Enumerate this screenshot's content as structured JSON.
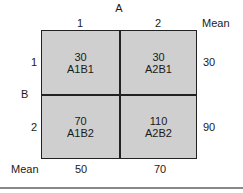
{
  "factor_a": {
    "label": "A",
    "levels": [
      "1",
      "2"
    ],
    "mean_label": "Mean"
  },
  "factor_b": {
    "label": "B",
    "levels": [
      "1",
      "2"
    ],
    "mean_label": "Mean"
  },
  "cells": [
    {
      "value": "30",
      "name": "A1B1"
    },
    {
      "value": "30",
      "name": "A2B1"
    },
    {
      "value": "70",
      "name": "A1B2"
    },
    {
      "value": "110",
      "name": "A2B2"
    }
  ],
  "row_means": [
    "30",
    "90"
  ],
  "column_means": [
    "50",
    "70"
  ]
}
